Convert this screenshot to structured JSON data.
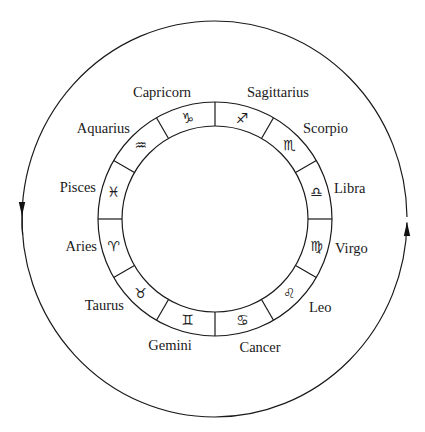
{
  "diagram": {
    "colors": {
      "ink": "#1a1a1a",
      "background": "#ffffff"
    },
    "outer_orbit": {
      "cx": 214.5,
      "cy": 219,
      "rx": 192.5,
      "ry": 198,
      "arrows": [
        {
          "side": "left",
          "direction": "down",
          "tip": [
            22,
            216
          ]
        },
        {
          "side": "right",
          "direction": "up",
          "tip": [
            407,
            222
          ]
        }
      ]
    },
    "ring": {
      "cx": 215,
      "cy": 219,
      "outer_r": 117,
      "inner_r": 93,
      "glyph_r": 105,
      "segments": 12
    },
    "signs": [
      {
        "name": "Sagittarius",
        "glyph": "♐",
        "angle": 15,
        "label": [
          278,
          97
        ],
        "anchor": "middle"
      },
      {
        "name": "Scorpio",
        "glyph": "♏",
        "angle": 45,
        "label": [
          303,
          133
        ],
        "anchor": "start"
      },
      {
        "name": "Libra",
        "glyph": "♎",
        "angle": 75,
        "label": [
          334,
          193
        ],
        "anchor": "start"
      },
      {
        "name": "Virgo",
        "glyph": "♍",
        "angle": 105,
        "label": [
          335,
          253
        ],
        "anchor": "start"
      },
      {
        "name": "Leo",
        "glyph": "♌",
        "angle": 135,
        "label": [
          309,
          312
        ],
        "anchor": "start"
      },
      {
        "name": "Cancer",
        "glyph": "♋",
        "angle": 165,
        "label": [
          260,
          352
        ],
        "anchor": "middle"
      },
      {
        "name": "Gemini",
        "glyph": "♊",
        "angle": 195,
        "label": [
          170,
          350
        ],
        "anchor": "middle"
      },
      {
        "name": "Taurus",
        "glyph": "♉",
        "angle": 225,
        "label": [
          124,
          310
        ],
        "anchor": "end"
      },
      {
        "name": "Aries",
        "glyph": "♈",
        "angle": 255,
        "label": [
          97,
          251
        ],
        "anchor": "end"
      },
      {
        "name": "Pisces",
        "glyph": "♓",
        "angle": 285,
        "label": [
          96,
          192
        ],
        "anchor": "end"
      },
      {
        "name": "Aquarius",
        "glyph": "♒",
        "angle": 315,
        "label": [
          130,
          133
        ],
        "anchor": "end"
      },
      {
        "name": "Capricorn",
        "glyph": "♑",
        "angle": 345,
        "label": [
          162,
          97
        ],
        "anchor": "middle"
      }
    ]
  }
}
